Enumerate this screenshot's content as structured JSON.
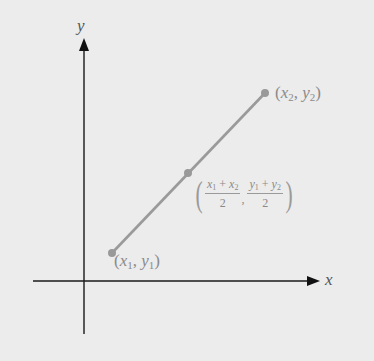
{
  "diagram": {
    "axes": {
      "x_label": "x",
      "y_label": "y"
    },
    "points": {
      "p1": {
        "label_var_x": "x",
        "label_sub_x": "1",
        "label_var_y": "y",
        "label_sub_y": "1",
        "open": "(",
        "sep": ", ",
        "close": ")"
      },
      "p2": {
        "label_var_x": "x",
        "label_sub_x": "2",
        "label_var_y": "y",
        "label_sub_y": "2",
        "open": "(",
        "sep": ", ",
        "close": ")"
      },
      "midpoint": {
        "open": "(",
        "close": ")",
        "x_num_a": "x",
        "x_num_a_sub": "1",
        "x_num_op": " + ",
        "x_num_b": "x",
        "x_num_b_sub": "2",
        "x_den": "2",
        "comma": ",",
        "y_num_a": "y",
        "y_num_a_sub": "1",
        "y_num_op": " + ",
        "y_num_b": "y",
        "y_num_b_sub": "2",
        "y_den": "2"
      }
    },
    "colors": {
      "background": "#ececec",
      "axis": "#1a1a1a",
      "segment": "#9a9a9a",
      "point": "#999999",
      "label": "#8a8a8a"
    }
  }
}
